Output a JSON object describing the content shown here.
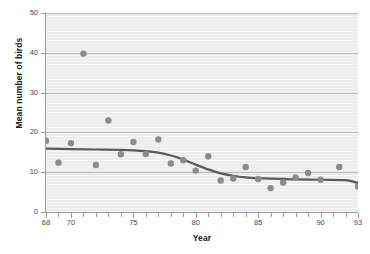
{
  "chart_data": {
    "type": "scatter",
    "title": "",
    "xlabel": "Year",
    "ylabel": "Mean number of birds",
    "xlim": [
      68,
      93
    ],
    "ylim": [
      0,
      50
    ],
    "grid": true,
    "legend": null,
    "xticks": [
      68,
      69,
      70,
      71,
      72,
      73,
      74,
      75,
      76,
      77,
      78,
      79,
      80,
      81,
      82,
      83,
      84,
      85,
      86,
      87,
      88,
      89,
      90,
      91,
      92,
      93
    ],
    "xtick_labels": [
      {
        "value": 68,
        "label": "68"
      },
      {
        "value": 70,
        "label": "70"
      },
      {
        "value": 75,
        "label": "75"
      },
      {
        "value": 80,
        "label": "80"
      },
      {
        "value": 85,
        "label": "85"
      },
      {
        "value": 90,
        "label": "90"
      },
      {
        "value": 93,
        "label": "93"
      }
    ],
    "yticks": [
      0,
      10,
      20,
      30,
      40,
      50
    ],
    "ytick_labels": [
      "0",
      "10",
      "20",
      "30",
      "40",
      "50"
    ],
    "marker_color": "#8b8b8b",
    "line_color": "#5a5a5a",
    "plot_background": "#ececec",
    "gridline_color": "#b9b9b9",
    "series": [
      {
        "name": "Mean number of birds",
        "type": "scatter",
        "x": [
          68,
          69,
          70,
          71,
          72,
          73,
          74,
          75,
          76,
          77,
          78,
          79,
          80,
          81,
          82,
          83,
          84,
          85,
          86,
          87,
          88,
          89,
          90,
          91.5,
          93
        ],
        "y": [
          17.9,
          12.4,
          17.3,
          39.8,
          11.8,
          23.0,
          14.5,
          17.6,
          14.6,
          18.2,
          12.2,
          13.0,
          10.4,
          14.0,
          7.9,
          8.4,
          11.3,
          8.3,
          6.0,
          7.4,
          8.7,
          9.8,
          8.1,
          11.3,
          6.4
        ]
      },
      {
        "name": "Smoothed trend",
        "type": "line",
        "x": [
          68,
          70,
          72,
          74,
          75,
          76,
          77,
          78,
          79,
          80,
          81,
          82,
          83,
          84,
          85,
          86,
          87,
          88,
          90,
          92,
          93
        ],
        "y": [
          15.9,
          15.8,
          15.7,
          15.6,
          15.5,
          15.3,
          14.9,
          14.2,
          13.2,
          11.9,
          10.7,
          9.7,
          9.1,
          8.7,
          8.5,
          8.4,
          8.3,
          8.2,
          8.1,
          8.0,
          7.3
        ]
      }
    ]
  }
}
